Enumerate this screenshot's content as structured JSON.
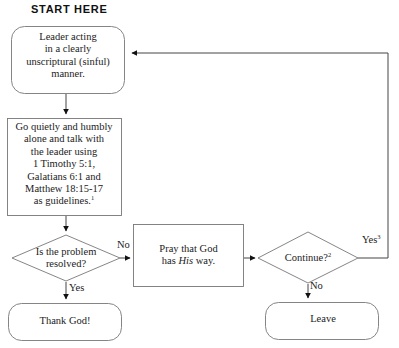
{
  "diagram": {
    "title_label": "START HERE",
    "nodes": {
      "leader": {
        "id": "leader-acting",
        "shape": "rounded-rectangle",
        "text": "Leader  acting\nin a clearly\nunscriptural (sinful)\nmanner."
      },
      "go_talk": {
        "id": "go-talk-to-leader",
        "shape": "rectangle",
        "text": "Go quietly and humbly\nalone and talk with\nthe leader using\n1 Timothy 5:1,\nGalatians 6:1 and\nMatthew 18:15-17\nas guidelines.",
        "footnote_marker": "1"
      },
      "resolved": {
        "id": "is-problem-resolved",
        "shape": "diamond",
        "text": "Is the problem\nresolved?"
      },
      "thank_god": {
        "id": "thank-god",
        "shape": "rounded-rectangle",
        "text": "Thank God!"
      },
      "pray": {
        "id": "pray-god-his-way",
        "shape": "rectangle",
        "text_before": "Pray that God\nhas ",
        "text_italic": "His",
        "text_after": " way."
      },
      "continue": {
        "id": "continue",
        "shape": "diamond",
        "text": "Continue?",
        "footnote_marker": "2"
      },
      "leave": {
        "id": "leave",
        "shape": "rounded-rectangle",
        "text": "Leave"
      }
    },
    "edge_labels": {
      "resolved_no": "No",
      "resolved_yes": "Yes",
      "continue_yes": "Yes",
      "continue_yes_footnote": "3",
      "continue_no": "No"
    },
    "colors": {
      "stroke": "#555555",
      "text": "#222222",
      "background": "#ffffff",
      "arrow_fill": "#000000"
    }
  }
}
